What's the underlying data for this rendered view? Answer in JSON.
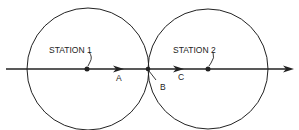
{
  "diagram": {
    "labels": {
      "station1": "STATION 1",
      "station2": "STATION 2",
      "pointA": "A",
      "pointB": "B",
      "pointC": "C"
    },
    "colors": {
      "stroke": "#222222",
      "background": "#ffffff"
    }
  }
}
